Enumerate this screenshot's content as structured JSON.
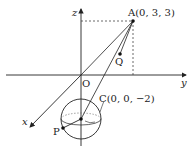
{
  "diagram": {
    "type": "3d-coordinate-geometry",
    "axes": {
      "x_label": "x",
      "y_label": "y",
      "z_label": "z",
      "origin_label": "O"
    },
    "points": {
      "A": {
        "label": "A(0, 3, 3)",
        "coords": [
          0,
          3,
          3
        ]
      },
      "C": {
        "label": "C(0, 0, −2)",
        "coords": [
          0,
          0,
          -2
        ]
      },
      "P": {
        "label": "P"
      },
      "Q": {
        "label": "Q"
      }
    },
    "elements": [
      "sphere centered at C",
      "segment A to C",
      "line from A through O",
      "segment A to Q",
      "dashed projections from A to z-axis and y-axis"
    ],
    "colors": {
      "line": "#222222",
      "dashed": "#444444",
      "background": "#ffffff"
    }
  }
}
